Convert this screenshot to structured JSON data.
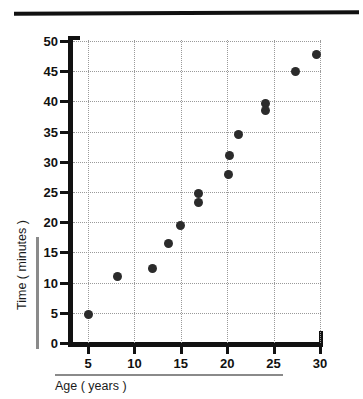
{
  "chart_data": {
    "type": "scatter",
    "title": "",
    "xlabel": "Age ( years )",
    "ylabel": "Time ( minutes )",
    "xlim": [
      2.5,
      32.5
    ],
    "ylim": [
      0,
      52
    ],
    "xticks": [
      5,
      10,
      15,
      20,
      25,
      30
    ],
    "yticks": [
      0,
      5,
      10,
      15,
      20,
      25,
      30,
      35,
      40,
      45,
      50
    ],
    "xtick_labels": [
      "5",
      "10",
      "15",
      "20",
      "25",
      "30"
    ],
    "ytick_labels": [
      "0",
      "5",
      "10",
      "15",
      "20",
      "25",
      "30",
      "35",
      "40",
      "45",
      "50"
    ],
    "grid": true,
    "grid_style": "dotted",
    "legend": null,
    "marker": "circle",
    "marker_color": "#2b2b2b",
    "points": [
      {
        "x": 5.0,
        "y": 4.8
      },
      {
        "x": 8.2,
        "y": 11.0
      },
      {
        "x": 11.9,
        "y": 12.4
      },
      {
        "x": 13.7,
        "y": 16.4
      },
      {
        "x": 15.0,
        "y": 19.5
      },
      {
        "x": 16.9,
        "y": 24.8
      },
      {
        "x": 16.9,
        "y": 23.2
      },
      {
        "x": 20.1,
        "y": 27.9
      },
      {
        "x": 20.2,
        "y": 31.0
      },
      {
        "x": 21.2,
        "y": 34.6
      },
      {
        "x": 24.1,
        "y": 39.6
      },
      {
        "x": 24.1,
        "y": 38.5
      },
      {
        "x": 27.4,
        "y": 44.9
      },
      {
        "x": 29.6,
        "y": 47.8
      }
    ]
  },
  "axes": {
    "y_title": "Time ( minutes )",
    "x_title": "Age ( years )"
  }
}
